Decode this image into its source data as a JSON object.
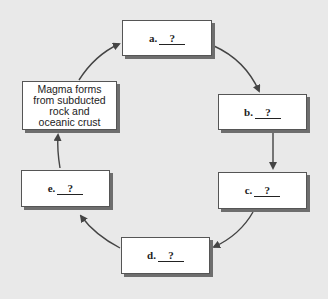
{
  "diagram": {
    "type": "cycle",
    "start_box": {
      "text": "Magma forms from subducted rock and oceanic crust",
      "lines": [
        "Magma forms",
        "from subducted",
        "rock and",
        "oceanic crust"
      ]
    },
    "steps": [
      {
        "letter": "a.",
        "blank": "?"
      },
      {
        "letter": "b.",
        "blank": "?"
      },
      {
        "letter": "c.",
        "blank": "?"
      },
      {
        "letter": "d.",
        "blank": "?"
      },
      {
        "letter": "e.",
        "blank": "?"
      }
    ],
    "flow": [
      "start",
      "a",
      "b",
      "c",
      "d",
      "e",
      "start"
    ],
    "colors": {
      "background": "#e9e9e9",
      "box": "#ffffff",
      "arrow": "#444444",
      "shadow": "#6e6e6e"
    }
  }
}
